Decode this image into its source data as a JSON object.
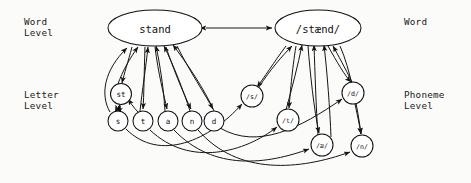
{
  "diagram": {
    "levels": {
      "word_left": "Word\nLevel",
      "letter_left": "Letter\nLevel",
      "word_right": "Word",
      "phoneme_right": "Phoneme\nLevel"
    },
    "colors": {
      "background": "#fbfbf9",
      "stroke": "#151515",
      "node_fill": "#ffffff",
      "text": "#111111"
    },
    "nodes": {
      "word_orthographic": {
        "label": "stand",
        "shape": "ellipse",
        "cx": 155,
        "cy": 28,
        "rx": 47,
        "ry": 18
      },
      "word_phonological": {
        "label": "/stænd/",
        "shape": "ellipse",
        "cx": 318,
        "cy": 28,
        "rx": 43,
        "ry": 18
      },
      "letter_cluster": {
        "label": "st",
        "shape": "circle",
        "cx": 121,
        "cy": 94,
        "r": 10.5
      },
      "letters": [
        {
          "label": "s",
          "cx": 118,
          "cy": 121,
          "r": 10
        },
        {
          "label": "t",
          "cx": 143,
          "cy": 121,
          "r": 10
        },
        {
          "label": "a",
          "cx": 168,
          "cy": 121,
          "r": 10
        },
        {
          "label": "n",
          "cx": 192,
          "cy": 121,
          "r": 10
        },
        {
          "label": "d",
          "cx": 214,
          "cy": 121,
          "r": 10
        }
      ],
      "phonemes": [
        {
          "label": "/s/",
          "cx": 252,
          "cy": 96,
          "r": 11
        },
        {
          "label": "/t/",
          "cx": 288,
          "cy": 120,
          "r": 11
        },
        {
          "label": "/d/",
          "cx": 353,
          "cy": 93,
          "r": 11
        },
        {
          "label": "/æ/",
          "cx": 322,
          "cy": 145,
          "r": 11
        },
        {
          "label": "/n/",
          "cx": 362,
          "cy": 146,
          "r": 11
        }
      ]
    },
    "edges": {
      "word_to_word": "bidirectional",
      "letters_to_word": "bottom-up arrows into 'stand'",
      "phonemes_to_word": "bottom-up arrows into '/stænd/'",
      "letters_to_phonemes": "curved cross-level arrows"
    }
  }
}
